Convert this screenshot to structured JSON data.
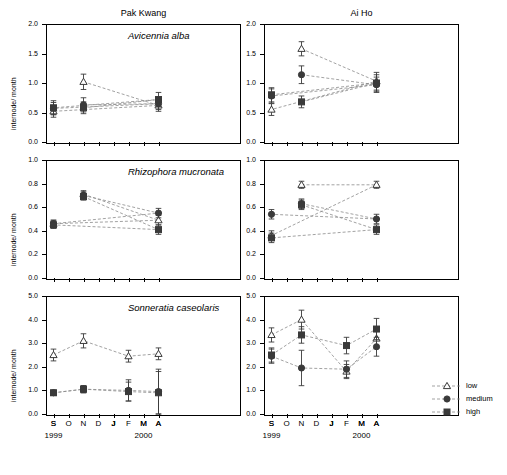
{
  "chart_data": {
    "type": "line",
    "columns": [
      {
        "key": "pak_kwang",
        "label": "Pak Kwang"
      },
      {
        "key": "ai_ho",
        "label": "Ai Ho"
      }
    ],
    "ylabel": "internode/ month",
    "xlabel_years": [
      "1999",
      "2000"
    ],
    "x": [
      "S",
      "O",
      "N",
      "D",
      "J",
      "F",
      "M",
      "A",
      "M",
      "J",
      "J",
      "A",
      "S"
    ],
    "legend": {
      "position": "bottom-right",
      "entries": [
        {
          "name": "low",
          "marker": "open-triangle"
        },
        {
          "name": "medium",
          "marker": "filled-circle"
        },
        {
          "name": "high",
          "marker": "filled-square"
        }
      ]
    },
    "rows": [
      {
        "species": "Avicennia alba",
        "ylim": [
          0.0,
          2.0
        ],
        "yticks": [
          "0.0",
          "0.5",
          "1.0",
          "1.5",
          "2.0"
        ],
        "panels": [
          {
            "site": "Pak Kwang",
            "series": [
              {
                "name": "low",
                "x": [
                  "N",
                  "A",
                  "S"
                ],
                "y": [
                  1.02,
                  0.62,
                  0.52
                ],
                "err": [
                  0.13,
                  0.1,
                  0.1
                ]
              },
              {
                "name": "medium",
                "x": [
                  "N",
                  "A",
                  "S"
                ],
                "y": [
                  0.63,
                  0.65,
                  0.57
                ],
                "err": [
                  0.12,
                  0.1,
                  0.1
                ]
              },
              {
                "name": "high",
                "x": [
                  "N",
                  "A",
                  "S"
                ],
                "y": [
                  0.58,
                  0.72,
                  0.58
                ],
                "err": [
                  0.1,
                  0.12,
                  0.12
                ]
              }
            ]
          },
          {
            "site": "Ai Ho",
            "series": [
              {
                "name": "low",
                "x": [
                  "N",
                  "A",
                  "S"
                ],
                "y": [
                  1.58,
                  1.03,
                  0.55
                ],
                "err": [
                  0.12,
                  0.15,
                  0.1
                ]
              },
              {
                "name": "medium",
                "x": [
                  "N",
                  "A",
                  "S"
                ],
                "y": [
                  1.14,
                  0.97,
                  0.78
                ],
                "err": [
                  0.15,
                  0.13,
                  0.12
                ]
              },
              {
                "name": "high",
                "x": [
                  "N",
                  "A",
                  "S"
                ],
                "y": [
                  0.68,
                  1.0,
                  0.8
                ],
                "err": [
                  0.1,
                  0.14,
                  0.12
                ]
              }
            ]
          }
        ]
      },
      {
        "species": "Rhizophora mucronata",
        "ylim": [
          0.0,
          1.0
        ],
        "yticks": [
          "0.0",
          "0.2",
          "0.4",
          "0.6",
          "0.8",
          "1.0"
        ],
        "panels": [
          {
            "site": "Pak Kwang",
            "series": [
              {
                "name": "low",
                "x": [
                  "N",
                  "A",
                  "S"
                ],
                "y": [
                  0.71,
                  0.49,
                  0.46
                ],
                "err": [
                  0.03,
                  0.04,
                  0.03
                ]
              },
              {
                "name": "medium",
                "x": [
                  "N",
                  "A",
                  "S"
                ],
                "y": [
                  0.7,
                  0.55,
                  0.46
                ],
                "err": [
                  0.03,
                  0.04,
                  0.03
                ]
              },
              {
                "name": "high",
                "x": [
                  "N",
                  "A",
                  "S"
                ],
                "y": [
                  0.69,
                  0.41,
                  0.45
                ],
                "err": [
                  0.03,
                  0.04,
                  0.03
                ]
              }
            ]
          },
          {
            "site": "Ai Ho",
            "series": [
              {
                "name": "low",
                "x": [
                  "N",
                  "A",
                  "S"
                ],
                "y": [
                  0.79,
                  0.79,
                  0.36
                ],
                "err": [
                  0.03,
                  0.03,
                  0.04
                ]
              },
              {
                "name": "medium",
                "x": [
                  "N",
                  "A",
                  "S"
                ],
                "y": [
                  0.63,
                  0.5,
                  0.54
                ],
                "err": [
                  0.04,
                  0.04,
                  0.04
                ]
              },
              {
                "name": "high",
                "x": [
                  "N",
                  "A",
                  "S"
                ],
                "y": [
                  0.62,
                  0.41,
                  0.34
                ],
                "err": [
                  0.04,
                  0.04,
                  0.04
                ]
              }
            ]
          }
        ]
      },
      {
        "species": "Sonneratia caseolaris",
        "ylim": [
          0.0,
          5.0
        ],
        "yticks": [
          "0.0",
          "1.0",
          "2.0",
          "3.0",
          "4.0",
          "5.0"
        ],
        "panels": [
          {
            "site": "Pak Kwang",
            "series": [
              {
                "name": "low",
                "x": [
                  "S",
                  "N",
                  "F",
                  "A"
                ],
                "y": [
                  2.5,
                  3.1,
                  2.45,
                  2.55
                ],
                "err": [
                  0.25,
                  0.3,
                  0.25,
                  0.25
                ]
              },
              {
                "name": "medium",
                "x": [
                  "S",
                  "N",
                  "F",
                  "A"
                ],
                "y": [
                  0.9,
                  1.05,
                  1.0,
                  0.95
                ],
                "err": [
                  0.1,
                  0.15,
                  0.45,
                  0.95
                ]
              },
              {
                "name": "high",
                "x": [
                  "S",
                  "N",
                  "F",
                  "A"
                ],
                "y": [
                  0.9,
                  1.05,
                  0.95,
                  0.9
                ],
                "err": [
                  0.1,
                  0.15,
                  0.4,
                  0.9
                ]
              }
            ]
          },
          {
            "site": "Ai Ho",
            "series": [
              {
                "name": "low",
                "x": [
                  "S",
                  "N",
                  "F",
                  "A"
                ],
                "y": [
                  3.35,
                  4.0,
                  1.8,
                  3.2
                ],
                "err": [
                  0.3,
                  0.4,
                  0.3,
                  0.4
                ]
              },
              {
                "name": "medium",
                "x": [
                  "S",
                  "N",
                  "F",
                  "A"
                ],
                "y": [
                  2.45,
                  1.95,
                  1.9,
                  2.85
                ],
                "err": [
                  0.3,
                  0.75,
                  0.35,
                  0.4
                ]
              },
              {
                "name": "high",
                "x": [
                  "S",
                  "N",
                  "F",
                  "A"
                ],
                "y": [
                  2.5,
                  3.35,
                  2.9,
                  3.6
                ],
                "err": [
                  0.3,
                  0.35,
                  0.35,
                  0.45
                ]
              }
            ]
          }
        ]
      }
    ]
  }
}
